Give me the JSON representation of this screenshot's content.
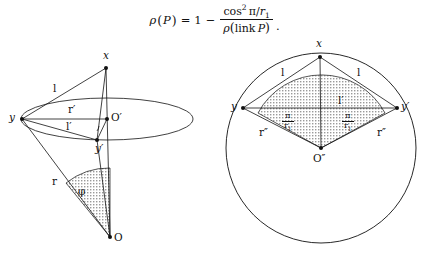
{
  "page": {
    "width": 429,
    "height": 255,
    "background": "#ffffff",
    "ink": "#111111",
    "shade_fill": "#bfbfbf"
  },
  "formula": {
    "lhs_rho": "ρ",
    "lhs_open": "(",
    "lhs_P": "P",
    "lhs_close": ")",
    "equals": "=",
    "one": "1",
    "minus": "−",
    "numerator_cos": "cos",
    "numerator_exponent": "2",
    "numerator_pi": "π",
    "numerator_slash": "/",
    "numerator_r": "r",
    "numerator_r_sub": "1",
    "denominator_rho": "ρ",
    "denominator_open": "(",
    "denominator_link": "link",
    "denominator_P": "P",
    "denominator_close": ")",
    "period": "."
  },
  "left_figure": {
    "name": "cone-with-ellipse-diagram",
    "points": {
      "apex_top": {
        "label": "x",
        "x": 106,
        "y": 68
      },
      "ellipse_center": {
        "label": "O′",
        "x": 107,
        "y": 119
      },
      "left_vertex": {
        "label": "y",
        "x": 22,
        "y": 119
      },
      "front_vertex": {
        "label": "y′",
        "x": 97,
        "y": 140
      },
      "apex_bottom": {
        "label": "O",
        "x": 110,
        "y": 237
      }
    },
    "segment_labels": {
      "slant_l": "l",
      "radius_r_prime": "r′",
      "chord_l_prime": "l′",
      "radius_r": "r",
      "angle_phi": "φ"
    }
  },
  "right_figure": {
    "name": "circle-with-inscribed-triangle-diagram",
    "points": {
      "top": {
        "label": "x",
        "x": 320,
        "y": 57
      },
      "left": {
        "label": "y",
        "x": 243,
        "y": 108
      },
      "right": {
        "label": "y′",
        "x": 397,
        "y": 108
      },
      "center": {
        "label": "O″",
        "x": 321,
        "y": 148
      }
    },
    "segment_labels": {
      "chord_l_left": "l",
      "chord_l_right": "l",
      "chord_l_prime": "l′",
      "radius_r_left": "r″",
      "radius_r_right": "r″"
    },
    "angle_labels": {
      "left_numerator": "π",
      "left_denominator_r": "r",
      "left_denominator_sub": "1",
      "right_numerator": "π",
      "right_denominator_r": "r",
      "right_denominator_sub": "1"
    }
  }
}
